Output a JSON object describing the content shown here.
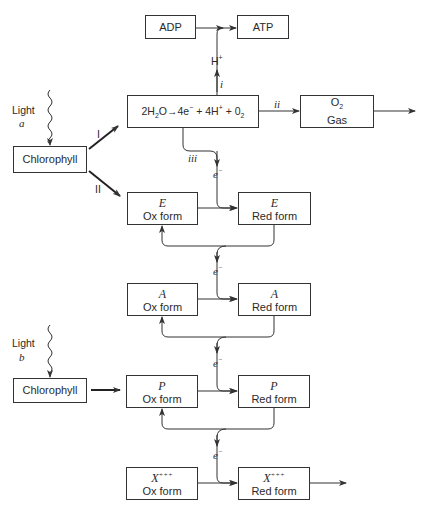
{
  "diagram": {
    "top": {
      "adp_label": "ADP",
      "atp_label": "ATP",
      "h_plus_label": "H",
      "h_plus_sup": "+",
      "path_i_label": "i",
      "path_ii_label": "ii",
      "path_iii_label": "iii"
    },
    "reaction": {
      "p1": "2H",
      "s1": "2",
      "p2": "O→4e",
      "s2": "−",
      "p3": " + 4H",
      "s3": "+",
      "p4": " + 0",
      "s4": "2"
    },
    "o2_box": {
      "line1": "O",
      "line1_sub": "2",
      "line2": "Gas"
    },
    "photosystem_a": {
      "light_label": "Light",
      "light_var": "a",
      "chlorophyll_label": "Chlorophyll",
      "branch_I": "I",
      "branch_II": "II"
    },
    "photosystem_b": {
      "light_label": "Light",
      "light_var": "b",
      "chlorophyll_label": "Chlorophyll"
    },
    "electron_label": "e",
    "electron_sup": "−",
    "carriers": [
      {
        "name": "E",
        "sup": "",
        "ox": "Ox form",
        "red": "Red form"
      },
      {
        "name": "A",
        "sup": "",
        "ox": "Ox form",
        "red": "Red form"
      },
      {
        "name": "P",
        "sup": "",
        "ox": "Ox form",
        "red": "Red form"
      },
      {
        "name": "X",
        "sup": "+++",
        "ox": "Ox form",
        "red": "Red form"
      }
    ]
  }
}
